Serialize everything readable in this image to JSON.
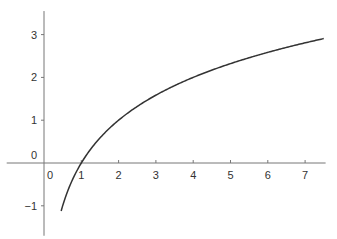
{
  "chart_data": {
    "type": "line",
    "title": "",
    "xlabel": "",
    "ylabel": "",
    "function": "y = log2(x)",
    "xlim": [
      -1.0,
      7.55
    ],
    "ylim": [
      -1.7,
      3.55
    ],
    "x_ticks": [
      0,
      1,
      2,
      3,
      4,
      5,
      6,
      7
    ],
    "y_ticks": [
      -1,
      0,
      1,
      2,
      3
    ],
    "x_tick_labels": [
      "0",
      "1",
      "2",
      "3",
      "4",
      "5",
      "6",
      "7"
    ],
    "y_tick_labels": [
      "−1",
      "0",
      "1",
      "2",
      "3"
    ],
    "grid": false,
    "legend": null,
    "series": [
      {
        "name": "log2(x)",
        "x": [
          0.46,
          0.5,
          0.75,
          1,
          1.5,
          2,
          2.5,
          3,
          3.5,
          4,
          4.5,
          5,
          5.5,
          6,
          6.5,
          7,
          7.5
        ],
        "y": [
          -1.12,
          -1,
          -0.415,
          0,
          0.585,
          1,
          1.32,
          1.585,
          1.807,
          2,
          2.17,
          2.32,
          2.46,
          2.585,
          2.7,
          2.807,
          2.907
        ]
      }
    ],
    "colors": {
      "axis": "#777777",
      "curve": "#333333",
      "text": "#333333"
    }
  }
}
